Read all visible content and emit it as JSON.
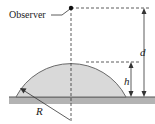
{
  "diagram": {
    "observer_label": "Observer",
    "labels": {
      "d": "d",
      "h": "h",
      "R": "R"
    },
    "colors": {
      "dome_fill": "#d9d9d9",
      "dome_stroke": "#6a6a6a",
      "ground_fill": "#b3b3b3",
      "ground_line": "#555555",
      "line": "#333333",
      "background": "#ffffff"
    }
  }
}
